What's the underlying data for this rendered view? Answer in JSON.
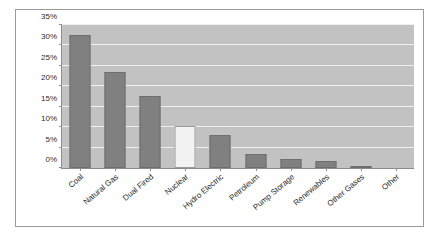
{
  "chart_data": {
    "type": "bar",
    "title": "",
    "subtitle": "",
    "xlabel": "",
    "ylabel": "",
    "categories": [
      "Coal",
      "Natural Gas",
      "Dual Fired",
      "Nuclear",
      "Hydro Electric",
      "Petroleum",
      "Pump Storage",
      "Renewables",
      "Other Gases",
      "Other"
    ],
    "values": [
      32.6,
      23.5,
      17.7,
      10.2,
      8.2,
      3.4,
      2.2,
      1.7,
      0.3,
      0.0
    ],
    "value_format": "percent",
    "ylim": [
      0,
      35
    ],
    "ytick_values": [
      0,
      5,
      10,
      15,
      20,
      25,
      30,
      35
    ],
    "ytick_labels": [
      "0%",
      "5%",
      "10%",
      "15%",
      "20%",
      "25%",
      "30%",
      "35%"
    ],
    "grid": true,
    "grid_axis": "y",
    "legend": false,
    "legend_position": "none",
    "series": [
      {
        "name": "Capacity Share",
        "values": [
          32.6,
          23.5,
          17.7,
          10.2,
          8.2,
          3.4,
          2.2,
          1.7,
          0.3,
          0.0
        ]
      }
    ],
    "bar_styles": [
      "filled",
      "filled",
      "filled",
      "hollow",
      "filled",
      "filled",
      "filled",
      "filled",
      "filled",
      "filled"
    ],
    "xlabel_rotation": -40
  },
  "colors": {
    "bar_fill": "#808080",
    "bar_border": "#6e6e6e",
    "hollow_fill": "#f2f2f2",
    "hollow_border": "#9a9a9a",
    "plot_background": "#c2c2c2",
    "gridline": "#efefef",
    "axis_line": "#8d8d8d",
    "frame_border": "#9a9a9a",
    "page_background": "#ffffff",
    "text": "#2b2b2b"
  }
}
